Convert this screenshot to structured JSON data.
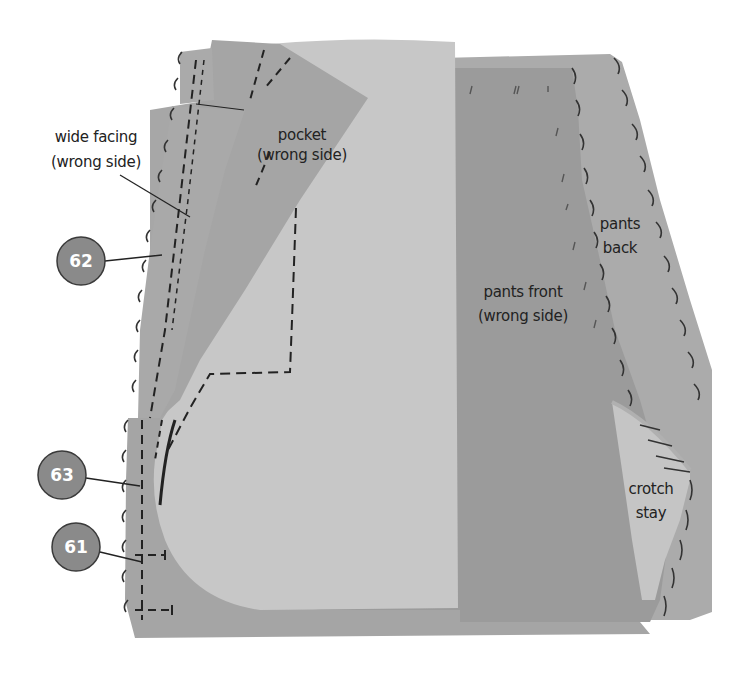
{
  "diagram": {
    "type": "sewing-instruction",
    "colors": {
      "background": "#ffffff",
      "pants_back": "#a9a9a9",
      "pants_front": "#999999",
      "pocket_lining_light": "#c6c6c6",
      "pocket": "#a4a4a4",
      "wide_facing": "#a7a7a7",
      "crotch_stay": "#c4c4c4",
      "stitch": "#222222",
      "badge_fill": "#8a8a8a",
      "badge_stroke": "#3a3a3a",
      "badge_text": "#ffffff"
    },
    "labels": {
      "pocket": [
        "pocket",
        "(wrong side)"
      ],
      "wide_facing": [
        "wide facing",
        "(wrong side)"
      ],
      "pants_front": [
        "pants front",
        "(wrong side)"
      ],
      "pants_back": [
        "pants",
        "back"
      ],
      "crotch_stay": [
        "crotch",
        "stay"
      ]
    },
    "callouts": [
      {
        "number": "62"
      },
      {
        "number": "63"
      },
      {
        "number": "61"
      }
    ]
  }
}
